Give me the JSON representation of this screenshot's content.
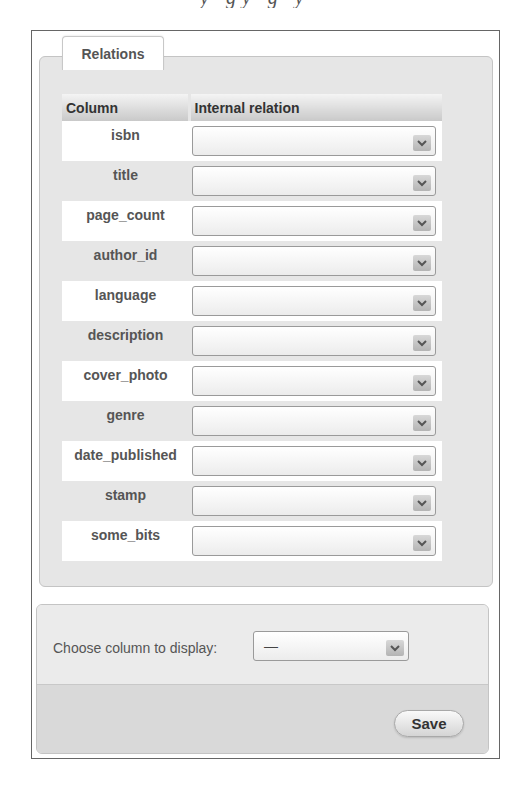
{
  "tab": {
    "label": "Relations"
  },
  "table": {
    "headers": [
      "Column",
      "Internal relation"
    ],
    "rows": [
      {
        "column": "isbn",
        "relation": ""
      },
      {
        "column": "title",
        "relation": ""
      },
      {
        "column": "page_count",
        "relation": ""
      },
      {
        "column": "author_id",
        "relation": ""
      },
      {
        "column": "language",
        "relation": ""
      },
      {
        "column": "description",
        "relation": ""
      },
      {
        "column": "cover_photo",
        "relation": ""
      },
      {
        "column": "genre",
        "relation": ""
      },
      {
        "column": "date_published",
        "relation": ""
      },
      {
        "column": "stamp",
        "relation": ""
      },
      {
        "column": "some_bits",
        "relation": ""
      }
    ]
  },
  "display": {
    "label": "Choose column to display:",
    "selected": "—"
  },
  "footer": {
    "save_label": "Save"
  },
  "icons": {
    "dropdown": "chevron-down-icon"
  }
}
